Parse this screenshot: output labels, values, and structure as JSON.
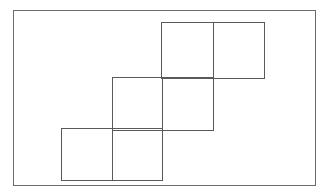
{
  "figure": {
    "canvas": {
      "width": 331,
      "height": 196,
      "background": "#ffffff"
    },
    "stroke_color": "#595959",
    "frame_stroke_color": "#6b6b6b",
    "stroke_width": 1,
    "frame_stroke_width": 1.4,
    "frame": {
      "name": "outer-frame",
      "x": 13,
      "y": 10,
      "width": 302,
      "height": 175
    },
    "shapes": [
      {
        "name": "rectangle-top-right",
        "label": "Top rectangle",
        "x": 161,
        "y": 22,
        "width": 103,
        "height": 56,
        "divider_x": 213
      },
      {
        "name": "rectangle-middle",
        "label": "Middle rectangle",
        "x": 112,
        "y": 77,
        "width": 101,
        "height": 53,
        "divider_x": 162
      },
      {
        "name": "rectangle-bottom-left",
        "label": "Bottom rectangle",
        "x": 61,
        "y": 128,
        "width": 101,
        "height": 52,
        "divider_x": 112
      }
    ],
    "offset_step": {
      "dx": -50,
      "dy": 53
    },
    "shape_count": 3
  }
}
